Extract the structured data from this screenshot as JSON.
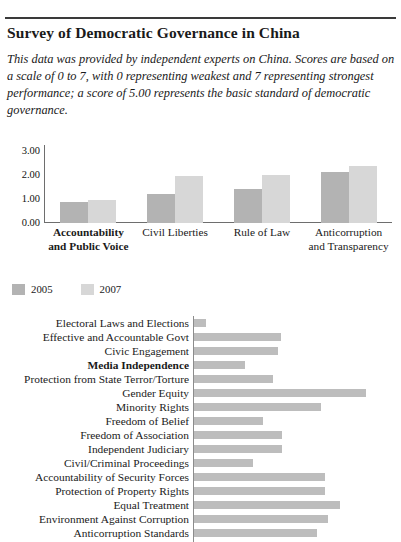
{
  "document": {
    "title": "Survey of Democratic Governance in China",
    "intro": "This data was provided by independent experts on China. Scores are based on a scale of 0 to 7, with 0 representing weakest and 7 representing strongest performance; a score of 5.00 represents the basic standard of democratic governance."
  },
  "legend": {
    "items": [
      {
        "label": "2005",
        "color": "#b3b3b3"
      },
      {
        "label": "2007",
        "color": "#d7d7d7"
      }
    ]
  },
  "chart_data": [
    {
      "type": "bar",
      "orientation": "vertical",
      "title": "",
      "xlabel": "",
      "ylabel": "",
      "ylim": [
        0,
        3
      ],
      "yticks": [
        "0.00",
        "1.00",
        "2.00",
        "3.00"
      ],
      "grid": false,
      "legend_position": "bottom-left",
      "categories": [
        "Accountability and Public Voice",
        "Civil Liberties",
        "Rule of Law",
        "Anticorruption and Transparency"
      ],
      "categories_lines": [
        [
          "Accountability",
          "and Public Voice"
        ],
        [
          "Civil Liberties"
        ],
        [
          "Rule of Law"
        ],
        [
          "Anticorruption",
          "and Transparency"
        ]
      ],
      "bold_categories": [
        "Accountability and Public Voice"
      ],
      "series": [
        {
          "name": "2005",
          "color": "#b3b3b3",
          "values": [
            0.8,
            1.13,
            1.29,
            1.96
          ]
        },
        {
          "name": "2007",
          "color": "#d7d7d7",
          "values": [
            0.88,
            1.79,
            1.83,
            2.21
          ]
        }
      ]
    },
    {
      "type": "bar",
      "orientation": "horizontal",
      "title": "",
      "xlabel": "",
      "ylabel": "",
      "xlim": [
        0,
        7
      ],
      "grid": false,
      "bar_color": "#bdbdbd",
      "bold_categories": [
        "Media Independence"
      ],
      "categories": [
        "Electoral Laws and Elections",
        "Effective and Accountable Govt",
        "Civic Engagement",
        "Media Independence",
        "Protection from State Terror/Torture",
        "Gender Equity",
        "Minority Rights",
        "Freedom of Belief",
        "Freedom of Association",
        "Independent Judiciary",
        "Civil/Criminal Proceedings",
        "Accountability of Security Forces",
        "Protection of Property Rights",
        "Equal Treatment",
        "Environment Against Corruption",
        "Anticorruption Standards"
      ],
      "values": [
        0.6,
        4.25,
        4.1,
        2.5,
        3.85,
        8.5,
        6.25,
        3.4,
        4.3,
        4.3,
        2.9,
        6.45,
        6.45,
        7.2,
        6.6,
        6.0
      ],
      "bar_pixel_widths": [
        12,
        87,
        84,
        51,
        79,
        172,
        127,
        69,
        88,
        88,
        59,
        131,
        131,
        146,
        134,
        123
      ]
    }
  ]
}
